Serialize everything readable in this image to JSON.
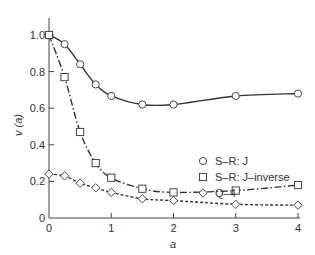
{
  "chart_data": {
    "type": "line",
    "title": "",
    "xlabel": "a",
    "ylabel": "v (a)",
    "xlim": [
      0,
      4
    ],
    "ylim": [
      0,
      1.0
    ],
    "grid": false,
    "legend_position": "center-right",
    "x_ticks": [
      {
        "value": 0,
        "label": "0"
      },
      {
        "value": 1,
        "label": "1"
      },
      {
        "value": 2,
        "label": "2"
      },
      {
        "value": 3,
        "label": "3"
      },
      {
        "value": 4,
        "label": "4"
      }
    ],
    "y_ticks": [
      {
        "value": 0,
        "label": "0"
      },
      {
        "value": 0.2,
        "label": "0.2"
      },
      {
        "value": 0.4,
        "label": "0.4"
      },
      {
        "value": 0.6,
        "label": "0.6"
      },
      {
        "value": 0.8,
        "label": "0.8"
      },
      {
        "value": 1.0,
        "label": "1.0"
      }
    ],
    "series": [
      {
        "name": "S–R: J",
        "marker": "circle",
        "line_style": "solid",
        "x": [
          0,
          0.25,
          0.5,
          0.75,
          1,
          1.5,
          2,
          3,
          4
        ],
        "values": [
          1.0,
          0.95,
          0.84,
          0.73,
          0.667,
          0.62,
          0.62,
          0.667,
          0.68
        ]
      },
      {
        "name": "S–R: J–inverse",
        "marker": "square",
        "line_style": "dash-dot",
        "x": [
          0,
          0.25,
          0.5,
          0.75,
          1,
          1.5,
          2,
          3,
          4
        ],
        "values": [
          1.0,
          0.77,
          0.47,
          0.3,
          0.22,
          0.16,
          0.14,
          0.15,
          0.18
        ]
      },
      {
        "name": "Q–4",
        "marker": "diamond",
        "line_style": "dashed",
        "x": [
          0,
          0.25,
          0.5,
          0.75,
          1,
          1.5,
          2,
          3,
          4
        ],
        "values": [
          0.24,
          0.23,
          0.19,
          0.165,
          0.14,
          0.105,
          0.095,
          0.075,
          0.07
        ]
      }
    ]
  },
  "colors": {
    "ink": "#333333",
    "marker_fill": "#ffffff"
  }
}
